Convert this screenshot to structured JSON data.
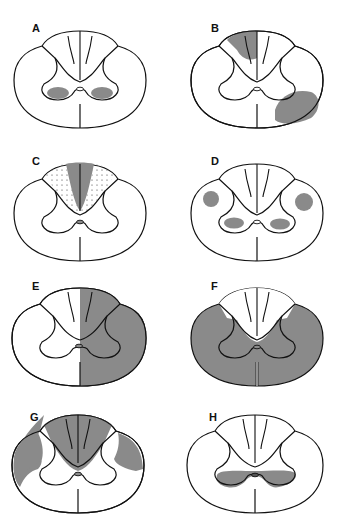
{
  "figure": {
    "colors": {
      "lesion": "#8a8a8a",
      "outline": "#111111",
      "background": "#ffffff"
    },
    "panels": [
      {
        "label": "A",
        "description": "Bilateral ventral horn lesions"
      },
      {
        "label": "B",
        "description": "Unilateral dorsal column and ventrolateral white matter lesion"
      },
      {
        "label": "C",
        "description": "Dorsal column lesion (fasciculus gracilis shaded, cuneatus stippled)"
      },
      {
        "label": "D",
        "description": "Bilateral lateral column and ventral horn lesions"
      },
      {
        "label": "E",
        "description": "Hemisection of the cord"
      },
      {
        "label": "F",
        "description": "Ventral and lateral cord lesion sparing dorsal columns"
      },
      {
        "label": "G",
        "description": "Dorsal columns and bilateral lateral corticospinal tracts"
      },
      {
        "label": "H",
        "description": "Central cord lesion around central canal"
      }
    ]
  }
}
